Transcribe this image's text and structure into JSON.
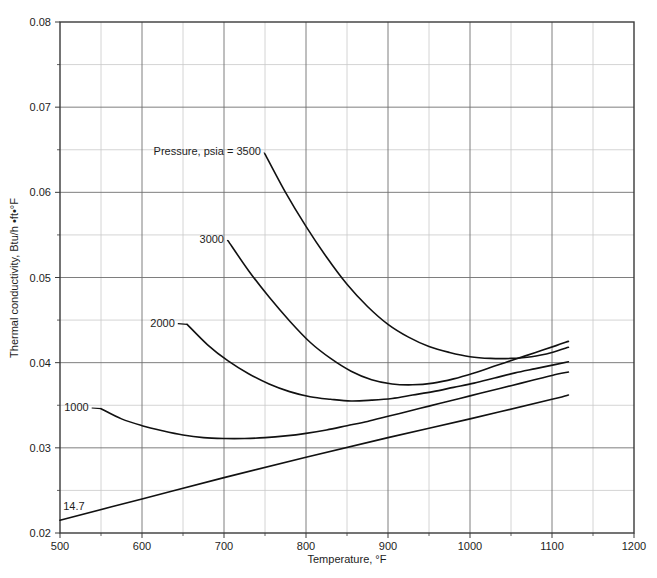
{
  "chart_data": {
    "type": "line",
    "title": "",
    "xlabel": "Temperature, °F",
    "ylabel": "Thermal conductivity, Btu/h •ft•°F",
    "xlim": [
      500,
      1200
    ],
    "ylim": [
      0.02,
      0.08
    ],
    "xticks": [
      500,
      600,
      700,
      800,
      900,
      1000,
      1100,
      1200
    ],
    "xtick_labels": [
      "500",
      "600",
      "700",
      "800",
      "900",
      "1000",
      "1100",
      "1200"
    ],
    "yticks": [
      0.02,
      0.03,
      0.04,
      0.05,
      0.06,
      0.07,
      0.08
    ],
    "ytick_labels": [
      "0.02",
      "0.03",
      "0.04",
      "0.05",
      "0.06",
      "0.07",
      "0.08"
    ],
    "x_minor_step": 50,
    "y_minor_step": 0.005,
    "grid": true,
    "grid_major_color": "#6f6f6f",
    "grid_minor_color": "#c9c9c9",
    "frame_color": "#3a3a3a",
    "curve_color": "#111111",
    "legend": "none",
    "annotation": "Pressure, psia = 3500",
    "series": [
      {
        "name": "3500",
        "label": "Pressure, psia = 3500",
        "label_x": 745,
        "label_y": 0.0648,
        "points": [
          [
            750,
            0.0645
          ],
          [
            775,
            0.06
          ],
          [
            800,
            0.056
          ],
          [
            825,
            0.0524
          ],
          [
            850,
            0.0492
          ],
          [
            875,
            0.0466
          ],
          [
            900,
            0.0445
          ],
          [
            925,
            0.043
          ],
          [
            950,
            0.0419
          ],
          [
            975,
            0.0412
          ],
          [
            1000,
            0.0407
          ],
          [
            1025,
            0.0405
          ],
          [
            1050,
            0.0405
          ],
          [
            1075,
            0.0407
          ],
          [
            1100,
            0.0412
          ],
          [
            1120,
            0.0418
          ]
        ]
      },
      {
        "name": "3000",
        "label": "3000",
        "label_x": 700,
        "label_y": 0.0545,
        "points": [
          [
            705,
            0.0543
          ],
          [
            730,
            0.0508
          ],
          [
            755,
            0.0477
          ],
          [
            780,
            0.0449
          ],
          [
            805,
            0.0424
          ],
          [
            830,
            0.0405
          ],
          [
            855,
            0.039
          ],
          [
            880,
            0.038
          ],
          [
            905,
            0.0375
          ],
          [
            930,
            0.0374
          ],
          [
            955,
            0.0376
          ],
          [
            980,
            0.0381
          ],
          [
            1005,
            0.0388
          ],
          [
            1030,
            0.0396
          ],
          [
            1055,
            0.0404
          ],
          [
            1080,
            0.0412
          ],
          [
            1105,
            0.042
          ],
          [
            1120,
            0.0425
          ]
        ]
      },
      {
        "name": "2000",
        "label": "2000",
        "label_x": 640,
        "label_y": 0.0447,
        "points": [
          [
            655,
            0.0445
          ],
          [
            680,
            0.0421
          ],
          [
            705,
            0.0402
          ],
          [
            730,
            0.0387
          ],
          [
            755,
            0.0375
          ],
          [
            780,
            0.0366
          ],
          [
            805,
            0.036
          ],
          [
            830,
            0.0357
          ],
          [
            855,
            0.0355
          ],
          [
            880,
            0.0356
          ],
          [
            905,
            0.0358
          ],
          [
            930,
            0.0362
          ],
          [
            955,
            0.0366
          ],
          [
            980,
            0.0371
          ],
          [
            1005,
            0.0376
          ],
          [
            1030,
            0.0382
          ],
          [
            1055,
            0.0388
          ],
          [
            1080,
            0.0393
          ],
          [
            1105,
            0.0398
          ],
          [
            1120,
            0.0401
          ]
        ]
      },
      {
        "name": "1000",
        "label": "1000",
        "label_x": 535,
        "label_y": 0.0348,
        "points": [
          [
            550,
            0.0346
          ],
          [
            575,
            0.0334
          ],
          [
            600,
            0.0326
          ],
          [
            625,
            0.032
          ],
          [
            650,
            0.0315
          ],
          [
            675,
            0.0312
          ],
          [
            700,
            0.0311
          ],
          [
            725,
            0.0311
          ],
          [
            750,
            0.0312
          ],
          [
            775,
            0.0314
          ],
          [
            800,
            0.0317
          ],
          [
            825,
            0.0321
          ],
          [
            850,
            0.0326
          ],
          [
            875,
            0.0331
          ],
          [
            900,
            0.0337
          ],
          [
            925,
            0.0343
          ],
          [
            950,
            0.0349
          ],
          [
            975,
            0.0355
          ],
          [
            1000,
            0.0361
          ],
          [
            1025,
            0.0367
          ],
          [
            1050,
            0.0373
          ],
          [
            1075,
            0.0379
          ],
          [
            1100,
            0.0385
          ],
          [
            1120,
            0.0389
          ]
        ]
      },
      {
        "name": "14.7",
        "label": "14.7",
        "label_x": 530,
        "label_y": 0.0232,
        "points": [
          [
            500,
            0.0215
          ],
          [
            600,
            0.024
          ],
          [
            700,
            0.0265
          ],
          [
            800,
            0.0289
          ],
          [
            900,
            0.0312
          ],
          [
            1000,
            0.0334
          ],
          [
            1100,
            0.0357
          ],
          [
            1120,
            0.0362
          ]
        ]
      }
    ]
  },
  "caption": {
    "text": ""
  }
}
